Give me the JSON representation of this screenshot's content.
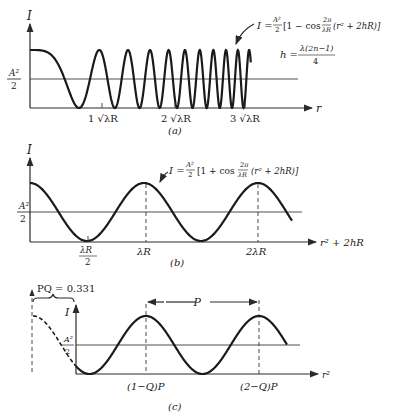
{
  "figure": {
    "panels": [
      {
        "id": "a",
        "caption": "(a)",
        "y_axis_label": "I",
        "x_axis_label": "r",
        "mid_label_num": "A²",
        "mid_label_den": "2",
        "ticks": [
          "1 √λR",
          "2 √λR",
          "3 √λR"
        ],
        "formula": "I = A²/2 [1 − cos 2π/λR (r² + 2hR)]",
        "formula_parts": {
          "lhs": "I =",
          "frac_num": "A²",
          "frac_den": "2",
          "body1": "[1 − cos",
          "frac2_num": "2π",
          "frac2_den": "λR",
          "body2": "(r² + 2hR)]"
        },
        "h_formula": {
          "lhs": "h =",
          "num": "λ(2n−1)",
          "den": "4"
        }
      },
      {
        "id": "b",
        "caption": "(b)",
        "y_axis_label": "I",
        "x_axis_label": "r² + 2hR",
        "mid_label_num": "A²",
        "mid_label_den": "2",
        "ticks": [
          {
            "num": "λR",
            "den": "2"
          },
          "λR",
          "2λR"
        ],
        "formula": "I = A²/2 [1 + cos 2π/λR (r² + 2hR)]",
        "formula_parts": {
          "lhs": "I =",
          "frac_num": "A²",
          "frac_den": "2",
          "body1": "[1 + cos",
          "frac2_num": "2π",
          "frac2_den": "λR",
          "body2": "(r² + 2hR)]"
        }
      },
      {
        "id": "c",
        "caption": "(c)",
        "y_axis_label": "I",
        "x_axis_label": "r²",
        "mid_label_num": "A²",
        "mid_label_den": "2",
        "ticks": [
          "(1−Q)P",
          "(2−Q)P"
        ],
        "period_label": "P",
        "offset_label": "PQ = 0.331"
      }
    ]
  }
}
